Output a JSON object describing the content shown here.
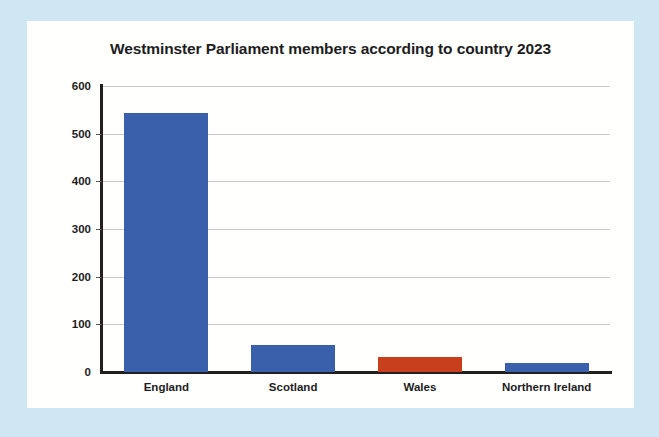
{
  "chart_data": {
    "type": "bar",
    "title": "Westminster Parliament members according to country 2023",
    "categories": [
      "England",
      "Scotland",
      "Wales",
      "Northern Ireland"
    ],
    "values": [
      543,
      57,
      32,
      18
    ],
    "series": [
      {
        "name": "Members",
        "values": [
          543,
          57,
          32,
          18
        ],
        "colors": [
          "#3a60ab",
          "#3a60ab",
          "#c73f1c",
          "#3a60ab"
        ]
      }
    ],
    "xlabel": "",
    "ylabel": "",
    "ylim": [
      0,
      600
    ],
    "yticks": [
      0,
      100,
      200,
      300,
      400,
      500,
      600
    ],
    "ytick_labels": [
      "0",
      "100",
      "200",
      "300",
      "400",
      "500",
      "600"
    ],
    "grid": true,
    "legend": false,
    "bar_colors": {
      "blue": "#3a60ab",
      "red": "#c73f1c"
    },
    "background": "#cfe7f3",
    "card_background": "#fffffd",
    "axis_color": "#231f20",
    "gridline_color": "#c9c9c9"
  }
}
